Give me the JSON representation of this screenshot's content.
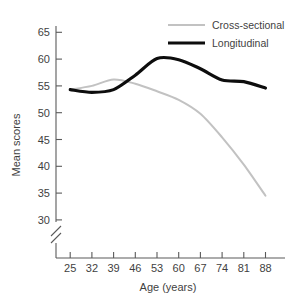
{
  "chart_data": {
    "type": "line",
    "title": "",
    "xlabel": "Age (years)",
    "ylabel": "Mean scores",
    "categories": [
      25,
      32,
      39,
      46,
      53,
      60,
      67,
      74,
      81,
      88
    ],
    "xticklabels": [
      "25",
      "32",
      "39",
      "46",
      "53",
      "60",
      "67",
      "74",
      "81",
      "88"
    ],
    "yticklabels": [
      "30",
      "35",
      "40",
      "45",
      "50",
      "55",
      "60",
      "65"
    ],
    "yticks": [
      30,
      35,
      40,
      45,
      50,
      55,
      60,
      65
    ],
    "ylim": [
      28,
      67
    ],
    "xlim": [
      21.5,
      91.5
    ],
    "grid": false,
    "y_axis_break": true,
    "legend_position": "top-right",
    "series": [
      {
        "name": "Cross-sectional",
        "color": "#c2c2c2",
        "values": [
          54.3,
          55.0,
          56.2,
          55.4,
          54.0,
          52.4,
          49.8,
          45.4,
          40.3,
          34.5
        ]
      },
      {
        "name": "Longitudinal",
        "color": "#0d0d0d",
        "values": [
          54.3,
          53.8,
          54.3,
          57.0,
          60.1,
          59.9,
          58.2,
          56.1,
          55.8,
          54.6
        ]
      }
    ]
  },
  "legend": {
    "entries": [
      {
        "label": "Cross-sectional",
        "swatch": "gray-line-swatch"
      },
      {
        "label": "Longitudinal",
        "swatch": "black-line-swatch"
      }
    ]
  },
  "axes": {
    "x_title": "Age (years)",
    "y_title": "Mean scores"
  }
}
